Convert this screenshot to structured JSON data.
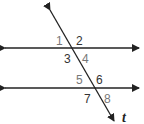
{
  "diagram": {
    "transversal_label": "t",
    "angles": [
      {
        "id": "1",
        "x": 56,
        "y": 45,
        "color": "#777777"
      },
      {
        "id": "2",
        "x": 76,
        "y": 45,
        "color": "#333333"
      },
      {
        "id": "3",
        "x": 64,
        "y": 63,
        "color": "#333333"
      },
      {
        "id": "4",
        "x": 82,
        "y": 63,
        "color": "#777777"
      },
      {
        "id": "5",
        "x": 76,
        "y": 84,
        "color": "#777777"
      },
      {
        "id": "6",
        "x": 96,
        "y": 84,
        "color": "#333333"
      },
      {
        "id": "7",
        "x": 84,
        "y": 103,
        "color": "#333333"
      },
      {
        "id": "8",
        "x": 104,
        "y": 103,
        "color": "#777777"
      }
    ],
    "line_color": "#222222"
  }
}
